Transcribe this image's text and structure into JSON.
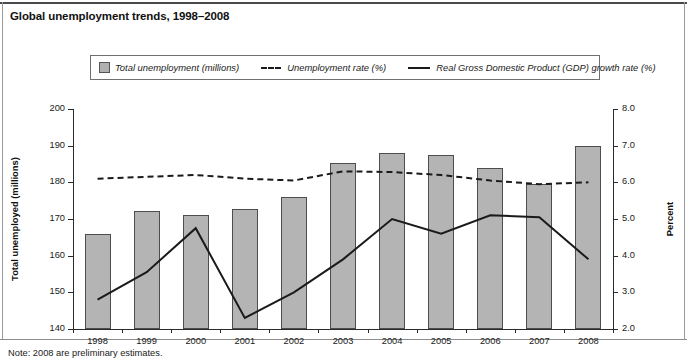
{
  "title": "Global unemployment trends, 1998–2008",
  "note": "Note: 2008 are preliminary estimates.",
  "legend": {
    "items": [
      {
        "label": "Total unemployment (millions)",
        "marker": "box",
        "color": "#b4b4b4"
      },
      {
        "label": "Unemployment rate (%)",
        "marker": "dashed-line",
        "color": "#1a1a1a"
      },
      {
        "label": "Real Gross Domestic Product (GDP) growth rate (%)",
        "marker": "solid-line",
        "color": "#1a1a1a"
      }
    ]
  },
  "axes": {
    "left_title": "Total unemployed (millions)",
    "right_title": "Percent",
    "left_ticks": [
      "200",
      "190",
      "180",
      "170",
      "160",
      "150",
      "140"
    ],
    "right_ticks": [
      "8.0",
      "7.0",
      "6.0",
      "5.0",
      "4.0",
      "3.0",
      "2.0"
    ]
  },
  "chart_data": {
    "type": "bar",
    "title": "Global unemployment trends, 1998–2008",
    "xlabel": "",
    "ylabel": "Total unemployed (millions)",
    "y2label": "Percent",
    "ylim": [
      140,
      200
    ],
    "y2lim": [
      2.0,
      8.0
    ],
    "grid": false,
    "legend_position": "top",
    "categories": [
      "1998",
      "1999",
      "2000",
      "2001",
      "2002",
      "2003",
      "2004",
      "2005",
      "2006",
      "2007",
      "2008"
    ],
    "series": [
      {
        "name": "Total unemployment (millions)",
        "type": "bar",
        "axis": "left",
        "values": [
          166.0,
          172.3,
          171.0,
          172.8,
          176.0,
          185.2,
          188.0,
          187.4,
          183.8,
          179.6,
          190.0
        ]
      },
      {
        "name": "Unemployment rate (%)",
        "type": "line",
        "style": "dashed",
        "axis": "right",
        "values": [
          6.1,
          6.15,
          6.2,
          6.1,
          6.05,
          6.3,
          6.28,
          6.2,
          6.05,
          5.95,
          6.0
        ]
      },
      {
        "name": "Real Gross Domestic Product (GDP) growth rate (%)",
        "type": "line",
        "style": "solid",
        "axis": "right",
        "values": [
          2.8,
          3.55,
          4.75,
          2.3,
          3.0,
          3.9,
          5.0,
          4.6,
          5.1,
          5.05,
          3.9
        ]
      }
    ],
    "annotations": [
      "Note: 2008 are preliminary estimates."
    ]
  }
}
